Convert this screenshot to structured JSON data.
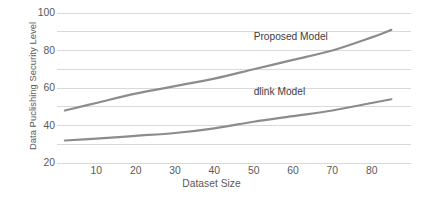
{
  "chart_data": {
    "type": "line",
    "title": "",
    "xlabel": "Dataset Size",
    "ylabel": "Data Puclishing Security Level",
    "xlim": [
      0,
      90
    ],
    "ylim": [
      20,
      100
    ],
    "xticks": [
      10,
      20,
      30,
      40,
      50,
      60,
      70,
      80
    ],
    "yticks": [
      20,
      40,
      60,
      80,
      100
    ],
    "gridlines_y": [
      20,
      30,
      40,
      50,
      60,
      70,
      80,
      90,
      100
    ],
    "grid": true,
    "legend_position": "inline-annotation",
    "x": [
      2,
      10,
      20,
      30,
      40,
      50,
      60,
      70,
      80,
      85
    ],
    "series": [
      {
        "name": "Proposed Model",
        "values": [
          48,
          52,
          57,
          61,
          65,
          70,
          75,
          80,
          87,
          91
        ],
        "color": "#8c8c8c",
        "label_x": 50,
        "label_y": 87
      },
      {
        "name": "dlink Model",
        "values": [
          32,
          33,
          34.5,
          36,
          38.5,
          42,
          45,
          48,
          52,
          54
        ],
        "color": "#8c8c8c",
        "label_x": 50,
        "label_y": 58
      }
    ],
    "colors": {
      "line": "#8c8c8c",
      "grid": "#d9d9d9",
      "tick_text": "#595959",
      "annotation_text": "#3d3d3d",
      "background": "#ffffff"
    }
  }
}
